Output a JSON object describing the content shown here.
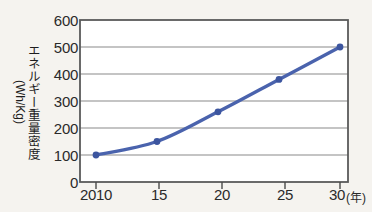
{
  "chart_data": {
    "type": "line",
    "title": "",
    "xlabel": "年",
    "ylabel": "エネルギー重量密度",
    "ylabel_unit": "(Wh/Kg)",
    "x_unit_annotation": "(年)",
    "categories": [
      "2010",
      "15",
      "20",
      "25",
      "30"
    ],
    "x": [
      2010,
      2015,
      2020,
      2025,
      2030
    ],
    "values": [
      100,
      150,
      260,
      380,
      500
    ],
    "series": [
      {
        "name": "エネルギー重量密度",
        "values": [
          100,
          150,
          260,
          380,
          500
        ]
      }
    ],
    "ylim": [
      0,
      600
    ],
    "yticks": [
      0,
      100,
      200,
      300,
      400,
      500,
      600
    ],
    "ytick_labels": [
      "0",
      "100",
      "200",
      "300",
      "400",
      "500",
      "600"
    ],
    "xtick_labels": [
      "2010",
      "15",
      "20",
      "25",
      "30"
    ],
    "grid": true,
    "grid_axis": "y",
    "legend": false,
    "legend_position": "none",
    "marker": "circle",
    "colors": {
      "line": "#4a63ad",
      "marker": "#3c559f",
      "grid": "#8a8a8a",
      "frame": "#5a5a5a",
      "text": "#1d1d1d",
      "background": "#f5f3ef"
    }
  }
}
